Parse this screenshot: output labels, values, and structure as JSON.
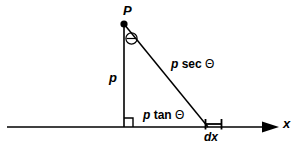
{
  "figure": {
    "kind": "geometry-diagram",
    "background_color": "#ffffff",
    "stroke_color": "#000000"
  },
  "labels": {
    "apex_point": "P",
    "vertical_leg": "p",
    "hypotenuse_var": "p",
    "hypotenuse_fn": "sec",
    "hypotenuse_theta": "Θ",
    "base_var": "p",
    "base_fn": "tan",
    "base_theta": "Θ",
    "angle_marker": "Θ",
    "differential": "dx",
    "axis": "x"
  },
  "text_full": {
    "hypotenuse": "p sec Θ",
    "base": "p tan Θ",
    "differential": "dx",
    "axis": "x",
    "apex": "P",
    "vertical": "p"
  },
  "geometry": {
    "apex": {
      "x": 124,
      "y": 24
    },
    "foot": {
      "x": 124,
      "y": 127
    },
    "base_end": {
      "x": 208,
      "y": 127
    },
    "axis_start": {
      "x": 7,
      "y": 127
    },
    "axis_end": {
      "x": 278,
      "y": 127
    },
    "dx_segment": {
      "x1": 205,
      "x2": 222,
      "y": 124
    },
    "angle_marker_center": {
      "x": 131,
      "y": 38
    },
    "angle_marker_radius": 6,
    "right_angle_size": 9,
    "apex_dot_radius": 3.5
  }
}
